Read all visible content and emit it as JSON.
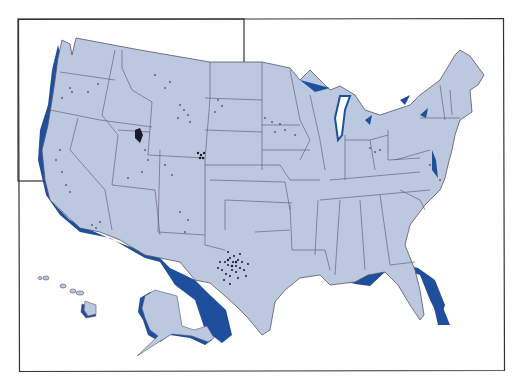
{
  "map": {
    "land_color": "#bcc8e0",
    "coast_shadow_color": "#1f4f9c",
    "border_color": "#555566",
    "dot_color": "#1a1a2a",
    "frame_color": "#333333",
    "regions": [
      "contiguous-us",
      "alaska",
      "hawaii"
    ],
    "dense_clusters": [
      "west-texas",
      "southwest-wyoming",
      "colorado-front-range",
      "northeast-utah"
    ]
  }
}
